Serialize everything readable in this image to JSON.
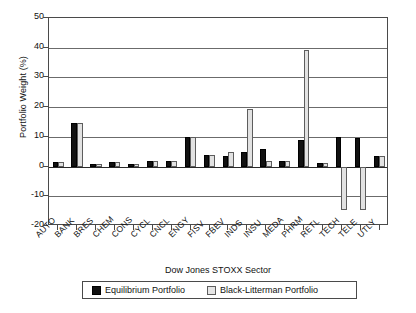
{
  "chart_data": {
    "type": "bar",
    "title": "",
    "xlabel": "Dow Jones STOXX Sector",
    "ylabel": "Portfolio Weight (%)",
    "ylim": [
      -20,
      50
    ],
    "yticks": [
      50,
      40,
      30,
      20,
      10,
      0,
      -10,
      -20
    ],
    "ytick_labels": [
      "50",
      "40",
      "30",
      "20",
      "10",
      "0",
      "-10",
      "-20"
    ],
    "grid": true,
    "grid_axis": "y",
    "legend_position": "bottom",
    "categories": [
      "AUTO",
      "BANK",
      "BRES",
      "CHEM",
      "CONS",
      "CYCL",
      "CNCL",
      "ENGY",
      "FISV",
      "FBEV",
      "INDS",
      "INSU",
      "MEDA",
      "PHRM",
      "RETL",
      "TECH",
      "TELE",
      "UTLY"
    ],
    "series": [
      {
        "name": "Equilibrium Portfolio",
        "color": "#111111",
        "values": [
          1.5,
          14.8,
          1.0,
          1.6,
          0.8,
          2.0,
          2.0,
          10.0,
          3.8,
          3.6,
          5.0,
          5.8,
          2.0,
          9.0,
          1.2,
          9.8,
          9.5,
          3.5
        ]
      },
      {
        "name": "Black-Litterman Portfolio",
        "color": "#e2e2e2",
        "values": [
          1.5,
          14.8,
          1.0,
          1.6,
          0.8,
          2.0,
          2.0,
          10.0,
          3.8,
          5.0,
          19.5,
          1.8,
          2.0,
          39.3,
          1.2,
          -14.5,
          -14.5,
          3.5
        ]
      }
    ]
  },
  "legend": {
    "entries": [
      {
        "label": "Equilibrium Portfolio",
        "swatch": "equilibrium"
      },
      {
        "label": "Black-Litterman Portfolio",
        "swatch": "blacklitterman"
      }
    ]
  }
}
